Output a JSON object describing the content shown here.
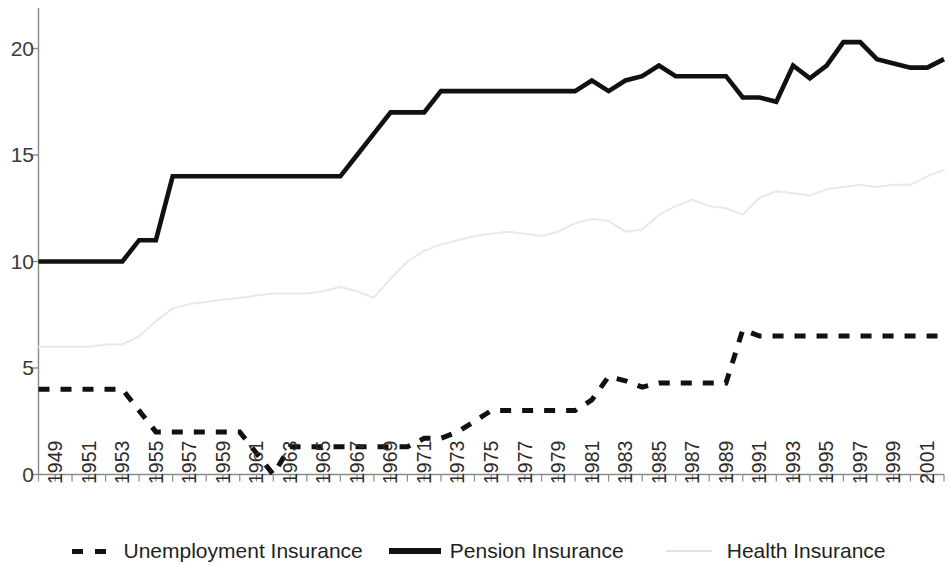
{
  "chart_data": {
    "type": "line",
    "title": "",
    "subtitle": "",
    "xlabel": "",
    "ylabel": "",
    "xlim": [
      1949,
      2003
    ],
    "ylim": [
      0,
      21.5
    ],
    "yticks": [
      0,
      5,
      10,
      15,
      20
    ],
    "ytick_labels": [
      "0",
      "5",
      "10",
      "15",
      "20"
    ],
    "grid": false,
    "legend_position": "bottom",
    "x": [
      1949,
      1950,
      1951,
      1952,
      1953,
      1954,
      1955,
      1956,
      1957,
      1958,
      1959,
      1960,
      1961,
      1962,
      1963,
      1964,
      1965,
      1966,
      1967,
      1968,
      1969,
      1970,
      1971,
      1972,
      1973,
      1974,
      1975,
      1976,
      1977,
      1978,
      1979,
      1980,
      1981,
      1982,
      1983,
      1984,
      1985,
      1986,
      1987,
      1988,
      1989,
      1990,
      1991,
      1992,
      1993,
      1994,
      1995,
      1996,
      1997,
      1998,
      1999,
      2000,
      2001,
      2002,
      2003
    ],
    "xtick_labels": [
      "1949",
      "1951",
      "1953",
      "1955",
      "1957",
      "1959",
      "1961",
      "1963",
      "1965",
      "1967",
      "1969",
      "1971",
      "1973",
      "1975",
      "1977",
      "1979",
      "1981",
      "1983",
      "1985",
      "1987",
      "1989",
      "1991",
      "1993",
      "1995",
      "1997",
      "1999",
      "2001",
      "2003"
    ],
    "series": [
      {
        "name": "Unemployment Insurance",
        "style": "dashed",
        "color": "#111111",
        "values": [
          4.0,
          4.0,
          4.0,
          4.0,
          4.0,
          4.0,
          3.0,
          2.0,
          2.0,
          2.0,
          2.0,
          2.0,
          2.0,
          1.0,
          0.0,
          1.3,
          1.3,
          1.3,
          1.3,
          1.3,
          1.3,
          1.3,
          1.3,
          1.7,
          1.7,
          2.0,
          2.5,
          3.0,
          3.0,
          3.0,
          3.0,
          3.0,
          3.0,
          3.5,
          4.6,
          4.4,
          4.1,
          4.3,
          4.3,
          4.3,
          4.3,
          4.3,
          6.8,
          6.5,
          6.5,
          6.5,
          6.5,
          6.5,
          6.5,
          6.5,
          6.5,
          6.5,
          6.5,
          6.5,
          6.5
        ]
      },
      {
        "name": "Pension Insurance",
        "style": "solid",
        "color": "#111111",
        "values": [
          10.0,
          10.0,
          10.0,
          10.0,
          10.0,
          10.0,
          11.0,
          11.0,
          14.0,
          14.0,
          14.0,
          14.0,
          14.0,
          14.0,
          14.0,
          14.0,
          14.0,
          14.0,
          14.0,
          15.0,
          16.0,
          17.0,
          17.0,
          17.0,
          18.0,
          18.0,
          18.0,
          18.0,
          18.0,
          18.0,
          18.0,
          18.0,
          18.0,
          18.5,
          18.0,
          18.5,
          18.7,
          19.2,
          18.7,
          18.7,
          18.7,
          18.7,
          17.7,
          17.7,
          17.5,
          19.2,
          18.6,
          19.2,
          20.3,
          20.3,
          19.5,
          19.3,
          19.1,
          19.1,
          19.5
        ]
      },
      {
        "name": "Health Insurance",
        "style": "light",
        "color": "#e8e8e8",
        "values": [
          6.0,
          6.0,
          6.0,
          6.0,
          6.1,
          6.1,
          6.5,
          7.2,
          7.8,
          8.0,
          8.1,
          8.2,
          8.3,
          8.4,
          8.5,
          8.5,
          8.5,
          8.6,
          8.8,
          8.6,
          8.3,
          9.2,
          10.0,
          10.5,
          10.8,
          11.0,
          11.2,
          11.3,
          11.4,
          11.3,
          11.2,
          11.4,
          11.8,
          12.0,
          11.9,
          11.4,
          11.5,
          12.2,
          12.6,
          12.9,
          12.6,
          12.5,
          12.2,
          13.0,
          13.3,
          13.2,
          13.1,
          13.4,
          13.5,
          13.6,
          13.5,
          13.6,
          13.6,
          14.0,
          14.3
        ]
      }
    ]
  },
  "legend": {
    "entries": [
      {
        "label": "Unemployment Insurance",
        "swatch": "dashed-line-swatch"
      },
      {
        "label": "Pension Insurance",
        "swatch": "solid-line-swatch"
      },
      {
        "label": "Health Insurance",
        "swatch": "light-line-swatch"
      }
    ]
  },
  "axis": {
    "y_axis_name": "value-axis",
    "x_axis_name": "year-axis"
  }
}
